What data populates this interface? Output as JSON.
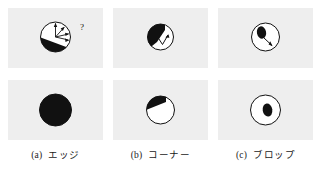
{
  "figure": {
    "background_color": "#ffffff",
    "panel_background_color": "#eeeeee",
    "ink_color": "#111111",
    "panel_count": 6,
    "rows": 2,
    "columns": 3
  },
  "columns": [
    {
      "tag": "(a)",
      "caption": "エッジ",
      "caption_romaji": "ejji",
      "caption_meaning": "edge",
      "top_panel": {
        "name": "edge-gradient-patch",
        "circle": {
          "cx": 47.5,
          "cy": 29,
          "r": 15
        },
        "dark_region": "lower-left half-plane below a diagonal boundary",
        "boundary_angle_deg": 20,
        "arrow_count": 4,
        "annotation": "?",
        "annotation_x": 73,
        "annotation_y": 19
      },
      "bottom_panel": {
        "name": "edge-feature-patch",
        "circle": {
          "cx": 47.5,
          "cy": 30,
          "r": 16
        },
        "dark_fraction": 0.88,
        "description": "circle almost fully dark, thin white sliver at upper right"
      }
    },
    {
      "tag": "(b)",
      "caption": "コーナー",
      "caption_romaji": "koonaa",
      "caption_meaning": "corner",
      "top_panel": {
        "name": "corner-gradient-patch",
        "circle": {
          "cx": 47.5,
          "cy": 29,
          "r": 13
        },
        "dark_region": "upper-left wedge",
        "arrow_count": 1,
        "annotation": "",
        "annotation_x": 0,
        "annotation_y": 0
      },
      "bottom_panel": {
        "name": "corner-feature-patch",
        "circle": {
          "cx": 47.5,
          "cy": 30,
          "r": 14
        },
        "dark_fraction": 0.2,
        "description": "dark triangular corner wedge at upper left"
      }
    },
    {
      "tag": "(c)",
      "caption": "ブロップ",
      "caption_romaji": "buroppu",
      "caption_meaning": "blob",
      "top_panel": {
        "name": "blob-gradient-patch",
        "circle": {
          "cx": 47.5,
          "cy": 29,
          "r": 14
        },
        "dark_region": "small dark ellipse upper left",
        "arrow_count": 1,
        "annotation": "",
        "annotation_x": 0,
        "annotation_y": 0
      },
      "bottom_panel": {
        "name": "blob-feature-patch",
        "circle": {
          "cx": 47.5,
          "cy": 30,
          "r": 15
        },
        "dark_fraction": 0.12,
        "description": "small dark ellipse near centre of circle"
      }
    }
  ]
}
